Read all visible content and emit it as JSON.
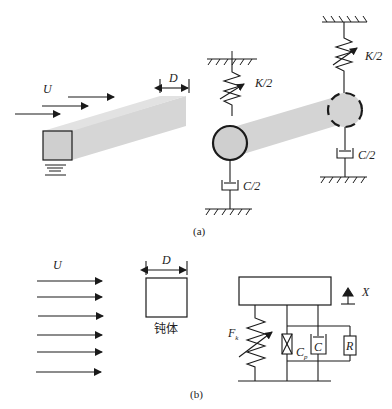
{
  "panel_a": {
    "caption": "(a)",
    "flow_label": "U",
    "width_label": "D",
    "spring_left_label": "K/2",
    "spring_right_label": "K/2",
    "damper_left_label": "C/2",
    "damper_right_label": "C/2"
  },
  "panel_b": {
    "caption": "(b)",
    "flow_label": "U",
    "width_label": "D",
    "body_label": "钝体",
    "displacement_label": "X",
    "spring_force_label": "F",
    "spring_force_sub": "k",
    "piezo_label": "C",
    "piezo_sub": "p",
    "damper_label": "C",
    "resistor_label": "R"
  },
  "colors": {
    "line": "#1a1a1a",
    "beam_fill": "#d4d4d4",
    "body_fill": "#cfcfcf"
  }
}
